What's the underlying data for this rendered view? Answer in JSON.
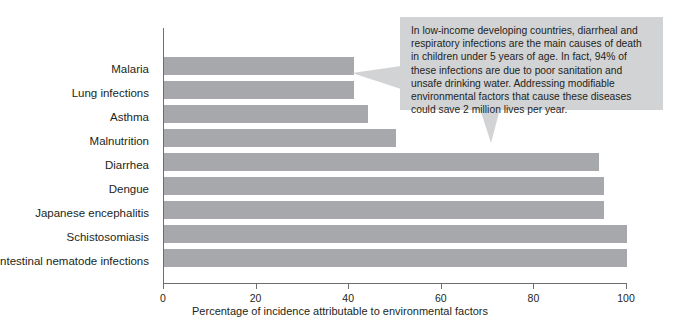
{
  "chart_data": {
    "type": "bar",
    "orientation": "horizontal",
    "title": "",
    "xlabel": "Percentage of incidence attributable to environmental factors",
    "ylabel": "",
    "xlim": [
      0,
      100
    ],
    "xticks": [
      "0",
      "20",
      "40",
      "60",
      "80",
      "100"
    ],
    "xtick_values": [
      0,
      20,
      40,
      60,
      80,
      100
    ],
    "grid": false,
    "legend": null,
    "bar_color": "#a6a8ab",
    "categories": [
      "Malaria",
      "Lung infections",
      "Asthma",
      "Malnutrition",
      "Diarrhea",
      "Dengue",
      "Japanese encephalitis",
      "Schistosomiasis",
      "Intestinal nematode infections"
    ],
    "values": [
      41,
      41,
      44,
      50,
      94,
      95,
      95,
      100,
      100
    ],
    "annotations": [
      {
        "text": "In low-income developing countries, diarrheal and respiratory infections are the main causes of death in children under 5 years of age. In fact, 94% of these infections are due to poor sanitation and unsafe drinking water. Addressing modifiable environmental factors that cause these diseases could save 2 million lives per year.",
        "background": "#d2d3d5"
      }
    ]
  }
}
